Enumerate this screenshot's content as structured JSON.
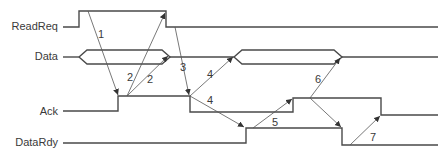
{
  "diagram": {
    "colors": {
      "wave": "#4a4a4a",
      "arrow": "#555555",
      "text": "#3a3a3a",
      "background": "#ffffff"
    },
    "signals": [
      {
        "id": "readreq",
        "label": "ReadReq",
        "label_x": 58,
        "label_y": 30,
        "type": "digital",
        "points": [
          [
            63,
            27
          ],
          [
            79,
            27
          ],
          [
            79,
            11
          ],
          [
            166,
            11
          ],
          [
            166,
            27
          ],
          [
            438,
            27
          ]
        ]
      },
      {
        "id": "data",
        "label": "Data",
        "label_x": 58,
        "label_y": 60,
        "type": "bus",
        "segments": [
          {
            "kind": "line",
            "points": [
              [
                63,
                57
              ],
              [
                79,
                57
              ]
            ]
          },
          {
            "kind": "valid",
            "x1": 79,
            "x2": 170,
            "yTop": 50,
            "yBot": 64,
            "ramp": 8
          },
          {
            "kind": "line",
            "points": [
              [
                170,
                57
              ],
              [
                234,
                57
              ]
            ]
          },
          {
            "kind": "valid",
            "x1": 234,
            "x2": 342,
            "yTop": 50,
            "yBot": 64,
            "ramp": 8
          },
          {
            "kind": "line",
            "points": [
              [
                342,
                57
              ],
              [
                438,
                57
              ]
            ]
          }
        ]
      },
      {
        "id": "ack",
        "label": "Ack",
        "label_x": 58,
        "label_y": 115,
        "type": "digital",
        "points": [
          [
            63,
            111
          ],
          [
            118,
            111
          ],
          [
            118,
            96
          ],
          [
            190,
            96
          ],
          [
            190,
            112
          ],
          [
            293,
            112
          ],
          [
            293,
            98
          ],
          [
            381,
            98
          ],
          [
            381,
            115
          ],
          [
            438,
            115
          ]
        ]
      },
      {
        "id": "datardy",
        "label": "DataRdy",
        "label_x": 58,
        "label_y": 146,
        "type": "digital",
        "points": [
          [
            63,
            143
          ],
          [
            246,
            143
          ],
          [
            246,
            128
          ],
          [
            342,
            128
          ],
          [
            342,
            145
          ],
          [
            438,
            145
          ]
        ]
      }
    ],
    "arrows": [
      {
        "step": "1",
        "from": [
          88,
          11
        ],
        "to": [
          118,
          95
        ],
        "label_x": 98,
        "label_y": 38
      },
      {
        "step": "2",
        "from": [
          127,
          96
        ],
        "to": [
          165,
          13
        ],
        "label_x": 127,
        "label_y": 81
      },
      {
        "step": "2",
        "from": [
          127,
          96
        ],
        "to": [
          168,
          56
        ],
        "label_x": 147,
        "label_y": 83
      },
      {
        "step": "3",
        "from": [
          175,
          27
        ],
        "to": [
          189,
          95
        ],
        "label_x": 180,
        "label_y": 71
      },
      {
        "step": "4",
        "from": [
          190,
          96
        ],
        "to": [
          233,
          57
        ],
        "label_x": 207,
        "label_y": 78
      },
      {
        "step": "4",
        "from": [
          190,
          96
        ],
        "to": [
          244,
          127
        ],
        "label_x": 207,
        "label_y": 104
      },
      {
        "step": "5",
        "from": [
          253,
          128
        ],
        "to": [
          292,
          99
        ],
        "label_x": 272,
        "label_y": 126
      },
      {
        "step": "6",
        "from": [
          310,
          98
        ],
        "to": [
          340,
          58
        ],
        "label_x": 315,
        "label_y": 83
      },
      {
        "step": "6",
        "from": [
          310,
          98
        ],
        "to": [
          341,
          127
        ],
        "label_x": null,
        "label_y": null
      },
      {
        "step": "7",
        "from": [
          350,
          145
        ],
        "to": [
          380,
          116
        ],
        "label_x": 370,
        "label_y": 141
      }
    ]
  }
}
